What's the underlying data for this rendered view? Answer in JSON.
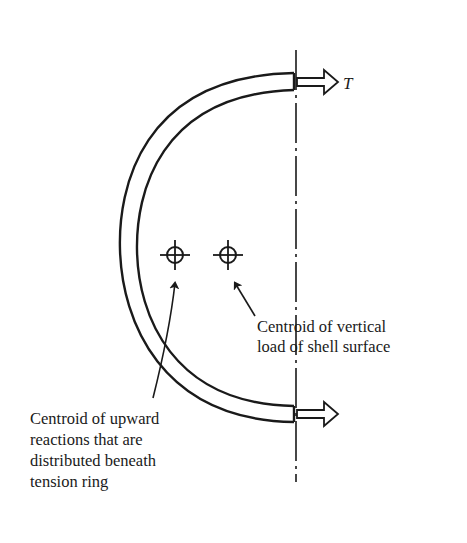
{
  "figure": {
    "type": "structural free-body sketch"
  },
  "labels": {
    "tension_force": "T",
    "centroid_vertical_load": [
      "Centroid of vertical",
      "load of shell surface"
    ],
    "centroid_upward_reactions": [
      "Centroid of upward",
      "reactions that are",
      "distributed beneath",
      "tension ring"
    ]
  },
  "symbols": {
    "centroid_marker": "crosshair-circle-icon",
    "force_arrow": "hollow-arrow-icon"
  },
  "colors": {
    "ink": "#1a1a1a",
    "background": "#ffffff"
  }
}
